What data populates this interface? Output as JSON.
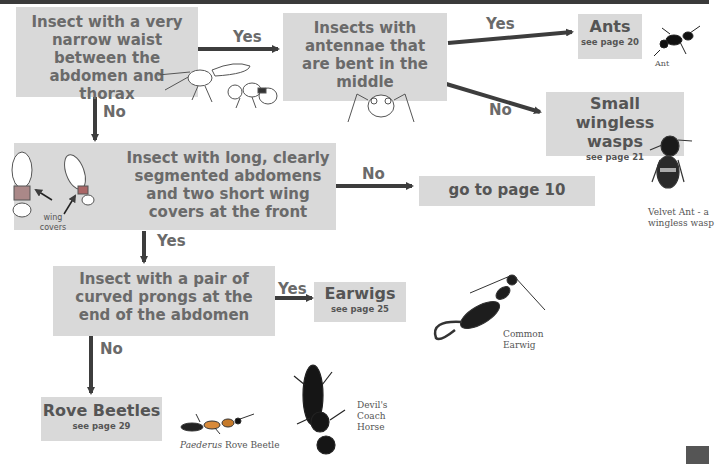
{
  "colors": {
    "box_bg": "#d9d9d9",
    "box_text": "#6a6a6a",
    "arrow": "#3d3d3d",
    "result_text": "#555555"
  },
  "questions": {
    "q1": "Insect with a very narrow waist between the abdomen and thorax",
    "q2": "Insects with antennae that are bent in the middle",
    "q3": "Insect with long, clearly segmented abdomens and two short wing covers at the front",
    "q4": "Insect with a pair of curved prongs at the end of the abdomen"
  },
  "results": {
    "ants": {
      "title": "Ants",
      "page": "see page 20"
    },
    "wasps": {
      "title": "Small wingless wasps",
      "page": "see page 21"
    },
    "goto": {
      "title": "go to page 10"
    },
    "earwigs": {
      "title": "Earwigs",
      "page": "see page 25"
    },
    "rove": {
      "title": "Rove Beetles",
      "page": "see page 29"
    }
  },
  "arrow_labels": {
    "q1_yes": "Yes",
    "q1_no": "No",
    "q2_yes": "Yes",
    "q2_no": "No",
    "q3_no": "No",
    "q3_yes": "Yes",
    "q4_yes": "Yes",
    "q4_no": "No"
  },
  "captions": {
    "ant": "Ant",
    "velvet_ant": "Velvet Ant - a wingless wasp",
    "wing_covers": "wing covers",
    "common_earwig": "Common Earwig",
    "paederus_italic": "Paederus",
    "paederus_rest": " Rove Beetle",
    "devils_coach_horse": "Devil's Coach Horse"
  }
}
